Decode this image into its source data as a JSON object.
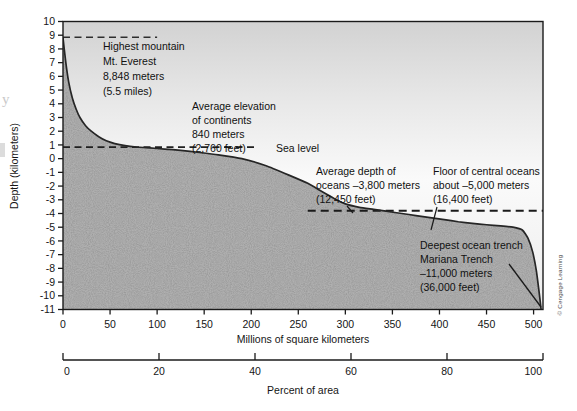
{
  "chart_data": {
    "type": "area",
    "title": "",
    "subtitle": "",
    "ylabel": "Depth (kilometers)",
    "xlabel": "Millions of square kilometers",
    "xlabel_secondary": "Percent of area",
    "ylim": [
      -11,
      10
    ],
    "xlim": [
      0,
      510
    ],
    "xlim_secondary": [
      0,
      100
    ],
    "grid": false,
    "legend": null,
    "yticks": [
      10,
      9,
      8,
      7,
      6,
      5,
      4,
      3,
      2,
      1,
      0,
      -1,
      -2,
      -3,
      -4,
      -5,
      -6,
      -7,
      -8,
      -9,
      -10,
      -11
    ],
    "ytick_labels": [
      "10",
      "9",
      "8",
      "7",
      "6",
      "5",
      "4",
      "3",
      "2",
      "1",
      "0",
      "-1",
      "-2",
      "-3",
      "-4",
      "-5",
      "-6",
      "-7",
      "-8",
      "-9",
      "-10",
      "-11"
    ],
    "xticks": [
      0,
      50,
      100,
      150,
      200,
      250,
      300,
      350,
      400,
      450,
      500
    ],
    "xtick_labels": [
      "0",
      "50",
      "100",
      "150",
      "200",
      "250",
      "300",
      "350",
      "400",
      "450",
      "500"
    ],
    "xticks_secondary": [
      0,
      20,
      40,
      60,
      80,
      100
    ],
    "xtick_labels_secondary": [
      "0",
      "20",
      "40",
      "60",
      "80",
      "100"
    ],
    "series": [
      {
        "name": "Hypsographic curve",
        "x": [
          0,
          3,
          6,
          10,
          14,
          18,
          24,
          30,
          38,
          46,
          55,
          66,
          78,
          92,
          108,
          125,
          145,
          165,
          190,
          215,
          240,
          260,
          275,
          288,
          300,
          315,
          330,
          345,
          360,
          375,
          390,
          405,
          420,
          435,
          450,
          465,
          478,
          488,
          494,
          499,
          503,
          506,
          508
        ],
        "y": [
          8.8,
          7.0,
          5.6,
          4.4,
          3.6,
          3.0,
          2.4,
          2.0,
          1.6,
          1.3,
          1.1,
          0.95,
          0.85,
          0.78,
          0.7,
          0.6,
          0.45,
          0.28,
          0.0,
          -0.5,
          -1.2,
          -1.8,
          -2.4,
          -2.9,
          -3.3,
          -3.55,
          -3.7,
          -3.85,
          -4.0,
          -4.15,
          -4.3,
          -4.45,
          -4.6,
          -4.72,
          -4.82,
          -4.9,
          -5.0,
          -5.2,
          -5.8,
          -6.8,
          -8.2,
          -9.8,
          -11.0
        ]
      }
    ],
    "reference_lines": [
      {
        "name": "everest",
        "value": 8.848,
        "style": "dashed",
        "x_start": 0,
        "x_end": 100
      },
      {
        "name": "average-elevation-continents",
        "value": 0.84,
        "style": "dashed",
        "x_start": 0,
        "x_end": 205
      },
      {
        "name": "ocean-floor",
        "value": -3.8,
        "style": "dashed",
        "x_start": 260,
        "x_end": 510
      }
    ]
  },
  "annotations": {
    "everest": {
      "lines": [
        "Highest mountain",
        "Mt. Everest",
        "8,848 meters",
        "(5.5 miles)"
      ]
    },
    "continents": {
      "lines": [
        "Average elevation",
        "of continents",
        "840 meters",
        "(2,760 feet)"
      ]
    },
    "sea_level": {
      "label": "Sea level"
    },
    "avg_ocean_depth": {
      "lines": [
        "Average depth of",
        "oceans –3,800 meters",
        "(12,450 feet)"
      ]
    },
    "central_ocean_floor": {
      "lines": [
        "Floor of central oceans",
        "about –5,000 meters",
        "(16,400 feet)"
      ]
    },
    "mariana": {
      "lines": [
        "Deepest ocean trench",
        "Mariana Trench",
        "–11,000 meters",
        "(36,000 feet)"
      ]
    }
  },
  "credit": {
    "text": "© Cengage Learning"
  },
  "margin_artifacts": {
    "letter_y": "y"
  },
  "colors": {
    "sky_top": "#d6d6d6",
    "sky_bottom": "#f7f7f7",
    "ocean_fill": "#b4b4b4",
    "land_fill": "#adadad",
    "curve": "#2b2b2b",
    "axis": "#1a1a1a",
    "text": "#111111",
    "page_background": "#ffffff"
  }
}
